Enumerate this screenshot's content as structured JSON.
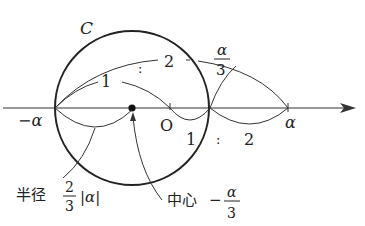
{
  "diagram": {
    "curve_label": "C",
    "ratio_top": {
      "left": "1",
      "sep": ":",
      "right": "2"
    },
    "ratio_bottom": {
      "left": "1",
      "sep": ":",
      "right": "2"
    },
    "point_labels": {
      "neg_alpha": "−α",
      "origin": "O",
      "alpha": "α",
      "alpha_over_3_num": "α",
      "alpha_over_3_den": "3"
    },
    "radius_label": {
      "text": "半径",
      "frac_num": "2",
      "frac_den": "3",
      "abs": "|α|"
    },
    "center_label": {
      "text": "中心",
      "sign": "−",
      "frac_num": "α",
      "frac_den": "3"
    },
    "colors": {
      "line": "#222222",
      "background": "#ffffff"
    }
  }
}
